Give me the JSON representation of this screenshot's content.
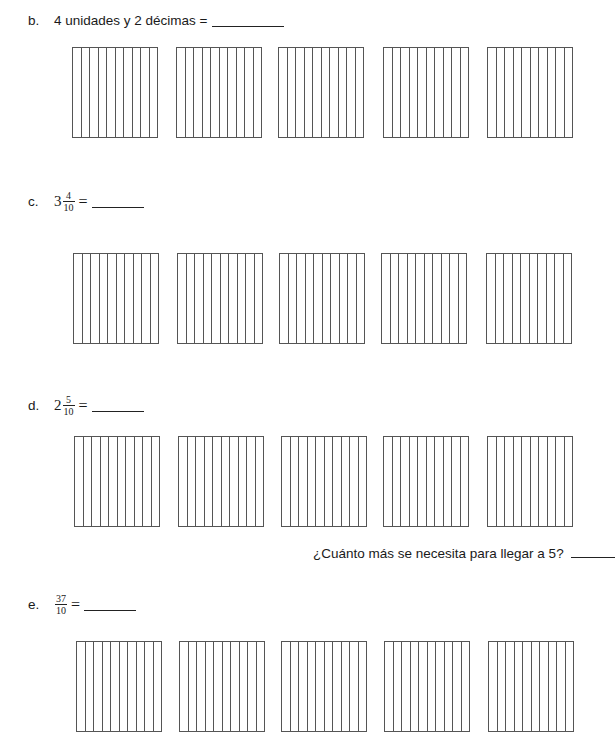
{
  "problems": {
    "b": {
      "letter": "b.",
      "text": "4 unidades y 2 décimas =",
      "boxes": 5,
      "strips_per_box": 10
    },
    "c": {
      "letter": "c.",
      "whole": "3",
      "numerator": "4",
      "denominator": "10",
      "equals": "=",
      "boxes": 5,
      "strips_per_box": 10
    },
    "d": {
      "letter": "d.",
      "whole": "2",
      "numerator": "5",
      "denominator": "10",
      "equals": "=",
      "boxes": 5,
      "strips_per_box": 10,
      "followup_question": "¿Cuánto más se necesita para llegar a 5?"
    },
    "e": {
      "letter": "e.",
      "numerator": "37",
      "denominator": "10",
      "equals": "=",
      "boxes": 5,
      "strips_per_box": 10
    }
  }
}
